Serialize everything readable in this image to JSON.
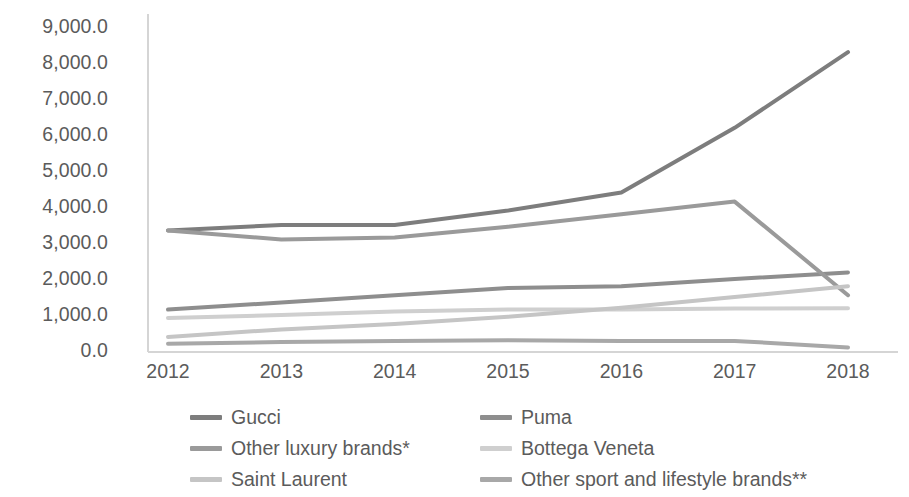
{
  "chart_data": {
    "type": "line",
    "title": "",
    "subtitle": "",
    "xlabel": "",
    "ylabel": "",
    "categories": [
      "2012",
      "2013",
      "2014",
      "2015",
      "2016",
      "2017",
      "2018"
    ],
    "x": [
      2012,
      2013,
      2014,
      2015,
      2016,
      2017,
      2018
    ],
    "ylim": [
      0,
      9000
    ],
    "ytick_values": [
      0,
      1000,
      2000,
      3000,
      4000,
      5000,
      6000,
      7000,
      8000,
      9000
    ],
    "ytick_labels": [
      "0.0",
      "1,000.0",
      "2,000.0",
      "3,000.0",
      "4,000.0",
      "5,000.0",
      "6,000.0",
      "7,000.0",
      "8,000.0",
      "9,000.0"
    ],
    "grid": false,
    "legend_position": "bottom",
    "series": [
      {
        "name": "Gucci",
        "color": "#7d7d7d",
        "values": [
          3350,
          3500,
          3500,
          3900,
          4400,
          6200,
          8300
        ]
      },
      {
        "name": "Puma",
        "color": "#8e8e8e",
        "values": [
          1150,
          1350,
          1550,
          1750,
          1800,
          2000,
          2180
        ]
      },
      {
        "name": "Other luxury brands*",
        "color": "#9a9a9a",
        "values": [
          3350,
          3100,
          3150,
          3450,
          3800,
          4150,
          1550
        ]
      },
      {
        "name": "Bottega Veneta",
        "color": "#cfcfcf",
        "values": [
          920,
          1000,
          1100,
          1150,
          1150,
          1180,
          1190
        ]
      },
      {
        "name": "Saint Laurent",
        "color": "#c5c5c5",
        "values": [
          390,
          600,
          750,
          950,
          1200,
          1500,
          1800
        ]
      },
      {
        "name": "Other sport and lifestyle brands**",
        "color": "#a8a8a8",
        "values": [
          200,
          250,
          280,
          300,
          280,
          280,
          100
        ]
      }
    ],
    "legend_entries": [
      "Gucci",
      "Puma",
      "Other luxury brands*",
      "Bottega Veneta",
      "Saint Laurent",
      "Other sport and lifestyle brands**"
    ]
  },
  "axis": {
    "axis_line_color": "#d5d5d5",
    "tick_label_color": "#5b5b5b"
  }
}
